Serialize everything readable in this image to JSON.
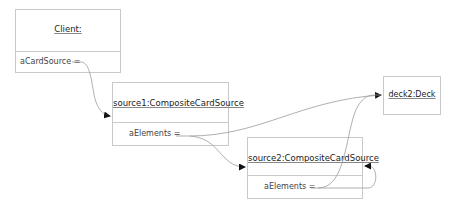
{
  "diagram": {
    "type": "object-diagram",
    "objects": [
      {
        "id": "client",
        "title": "Client:",
        "attributes": [
          {
            "label": "aCardSource ="
          }
        ]
      },
      {
        "id": "source1",
        "title": "source1:CompositeCardSource",
        "attributes": [
          {
            "label": "aElements ="
          }
        ]
      },
      {
        "id": "source2",
        "title": "source2:CompositeCardSource",
        "attributes": [
          {
            "label": "aElements ="
          }
        ]
      },
      {
        "id": "deck2",
        "title": "deck2:Deck",
        "attributes": []
      }
    ],
    "links": [
      {
        "from": "client.aCardSource",
        "to": "source1"
      },
      {
        "from": "source1.aElements",
        "to": "deck2"
      },
      {
        "from": "source1.aElements",
        "to": "source2"
      },
      {
        "from": "source2.aElements",
        "to": "deck2"
      },
      {
        "from": "source2.aElements",
        "to": "source2"
      }
    ],
    "colors": {
      "border": "#c9c9c9",
      "link": "#9a9a9a",
      "arrow": "#111111",
      "text": "#222222"
    }
  }
}
